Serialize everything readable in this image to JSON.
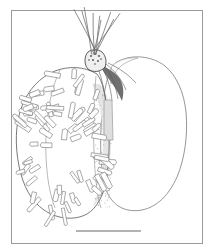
{
  "figure": {
    "kind": "scientific-line-drawing",
    "background_color": "#ffffff",
    "ink_color": "#555555",
    "dark_ink_color": "#3a3a3a",
    "light_ink_color": "#8f8f8f",
    "shade_fill": "#e8e8e8",
    "frame": {
      "name": "figure-border",
      "x": 11,
      "y": 10,
      "width": 191,
      "height": 233,
      "stroke": "#9a9a9a",
      "stroke_width": 1,
      "fill": "none"
    },
    "scale_bar": {
      "name": "scale-bar",
      "x1": 76,
      "y1": 231,
      "x2": 141,
      "y2": 231,
      "stroke": "#9a9a9a",
      "stroke_width": 1.6,
      "label": ""
    },
    "left_lobe": {
      "name": "setose-lobe",
      "outline": "M 97 74 C 84 66 68 66 55 71 C 40 77 28 90 22 106 C 15 124 15 146 19 166 C 23 186 31 201 44 210 C 57 219 74 221 87 214 C 97 208 103 196 106 182 C 110 160 110 132 107 110 C 105 94 103 82 97 74 Z",
      "stroke": "#6a6a6a",
      "fill": "#ffffff"
    },
    "shade_band": {
      "name": "stipple-shade-band",
      "path": "M 92 84 C 99 98 103 120 103 144 C 103 168 100 190 93 206 C 102 201 107 188 109 172 C 112 148 112 120 108 100 C 105 88 100 82 92 84 Z",
      "fill": "#e6e6e6"
    },
    "right_lobe": {
      "name": "smooth-lobe",
      "outline": "M 119 61 C 133 54 152 56 165 66 C 177 76 184 93 186 112 C 188 134 185 158 177 177 C 169 195 157 207 142 210 C 126 213 113 206 107 192 C 101 176 100 152 101 128 C 102 104 105 80 112 68 C 114 64 116 62 119 61 Z",
      "stroke": "#8a8a8a",
      "fill": "#ffffff"
    },
    "apex": {
      "name": "apex-node",
      "outline": "M 88 52 C 92 49 98 49 102 52 C 106 56 107 62 105 67 C 101 72 93 73 88 69 C 84 65 84 56 88 52 Z",
      "fill": "#efefef",
      "stroke": "#4a4a4a"
    },
    "junction": {
      "name": "dark-junction",
      "path": "M 100 65 C 108 68 115 72 120 79 C 124 86 124 94 122 101 C 119 95 116 88 111 82 C 107 77 103 71 100 65 Z",
      "fill": "#6f6f6f"
    },
    "apex_setae_count": 9,
    "club_setae_count": 78,
    "stipple_dot_count": 140
  }
}
